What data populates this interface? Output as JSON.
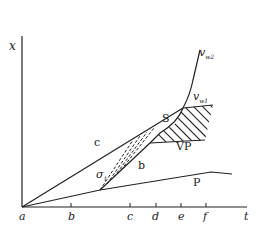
{
  "diagram": {
    "axes": {
      "y_label": "x",
      "x_label": "t",
      "origin_label": "a",
      "ticks": [
        "b",
        "c",
        "d",
        "e",
        "f"
      ]
    },
    "curves": {
      "c": "c",
      "b": "b",
      "s": "S",
      "vp": "VP",
      "p": "P",
      "sigma": "σ",
      "sigma_sub": "1",
      "vw2": "v",
      "vw2_sub": "w2",
      "vw1": "v",
      "vw1_sub": "w1"
    },
    "colors": {
      "line": "#222222",
      "background": "#ffffff"
    }
  }
}
